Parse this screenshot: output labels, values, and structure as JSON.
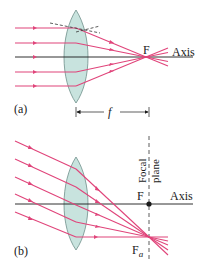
{
  "colors": {
    "ray": "#e0447a",
    "axis": "#1a1a1a",
    "lens_fill": "#c8e3de",
    "lens_stroke": "#6f8f8a",
    "dashed": "#333333"
  },
  "panel_a": {
    "label": "(a)",
    "focal_point_label": "F",
    "axis_label": "Axis",
    "focal_length_label": "f"
  },
  "panel_b": {
    "label": "(b)",
    "focal_point_label": "F",
    "axis_label": "Axis",
    "focal_plane_label_line1": "Focal",
    "focal_plane_label_line2": "plane",
    "off_axis_focus_label": "F",
    "off_axis_focus_subscript": "a"
  }
}
